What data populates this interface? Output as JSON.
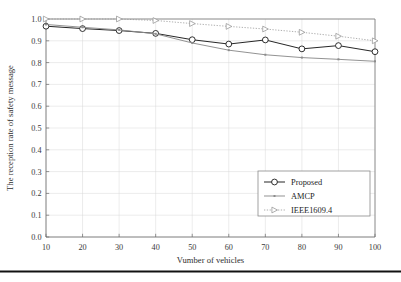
{
  "figure": {
    "background_color": "#ffffff",
    "bottom_rule_color": "#121212"
  },
  "chart_data": {
    "type": "line",
    "title": "",
    "xlabel": "Vumber of vehicles",
    "ylabel": "The reception rate of safety message",
    "x": [
      10,
      20,
      30,
      40,
      50,
      60,
      70,
      80,
      90,
      100
    ],
    "xticklabels": [
      "10",
      "20",
      "30",
      "40",
      "50",
      "60",
      "70",
      "80",
      "90",
      "100"
    ],
    "yticklabels": [
      "0.0",
      "0.1",
      "0.2",
      "0.3",
      "0.4",
      "0.5",
      "0.6",
      "0.7",
      "0.8",
      "0.9",
      "1.0"
    ],
    "xlim": [
      10,
      100
    ],
    "ylim": [
      0.0,
      1.0
    ],
    "grid": true,
    "legend_position": "lower right",
    "series": [
      {
        "name": "Proposed",
        "color": "#1a1a1a",
        "marker": "circle-open",
        "linestyle": "solid",
        "values": [
          0.967,
          0.956,
          0.947,
          0.934,
          0.905,
          0.885,
          0.904,
          0.863,
          0.878,
          0.85
        ]
      },
      {
        "name": "AMCP",
        "color": "#8c8c8c",
        "marker": "dot",
        "linestyle": "solid",
        "values": [
          0.975,
          0.962,
          0.95,
          0.932,
          0.89,
          0.857,
          0.836,
          0.823,
          0.815,
          0.806
        ]
      },
      {
        "name": "IEEE1609.4",
        "color": "#9a9a9a",
        "marker": "triangle-right-open",
        "linestyle": "dotted",
        "values": [
          1.0,
          1.0,
          1.0,
          0.993,
          0.979,
          0.966,
          0.954,
          0.939,
          0.921,
          0.9
        ]
      }
    ]
  }
}
